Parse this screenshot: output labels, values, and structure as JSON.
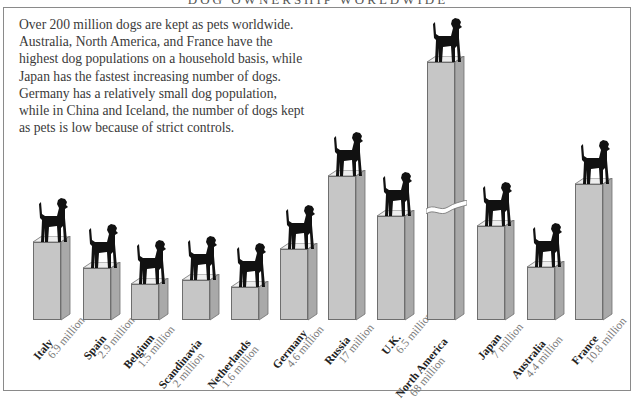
{
  "title": "DOG OWNERSHIP WORLDWIDE",
  "intro": "Over 200 million dogs are kept as pets worldwide. Australia, North America, and France have the highest dog populations on a household basis, while Japan has the fastest increasing number of dogs. Germany has a relatively small dog population, while in China and Iceland, the number of dogs kept as pets is low because of strict controls.",
  "colors": {
    "bar_front": "#c6c6c6",
    "bar_side": "#a9a9a9",
    "bar_top": "#eeeeee",
    "dog": "#111111",
    "border": "#8a8a8a"
  },
  "chart_data": {
    "type": "bar",
    "title": "DOG OWNERSHIP WORLDWIDE",
    "xlabel": "",
    "ylabel": "Number of pet dogs (millions)",
    "categories": [
      "Italy",
      "Spain",
      "Belgium",
      "Scandinavia",
      "Netherlands",
      "Germany",
      "Russia",
      "U.K.",
      "North America",
      "Japan",
      "Australia",
      "France"
    ],
    "values": [
      6.9,
      2.9,
      1.5,
      2,
      1.6,
      4.6,
      17,
      6.5,
      68,
      7,
      4.4,
      10.8
    ],
    "value_labels": [
      "6.9 million",
      "2.9 million",
      "1.5 million",
      "2 million",
      "1.6 million",
      "4.6 million",
      "17 million",
      "6.5 million",
      "68 million",
      "7 million",
      "4.4 million",
      "10.8 million"
    ],
    "annotations": [
      "North America bar has a broken axis (truncated)"
    ],
    "grid": false,
    "legend": null,
    "style": "3D pictorial bars with dog silhouettes on top"
  },
  "bars": [
    {
      "name": "Italy",
      "value": "6.9 million",
      "x": 33,
      "top": 242
    },
    {
      "name": "Spain",
      "value": "2.9 million",
      "x": 83,
      "top": 268
    },
    {
      "name": "Belgium",
      "value": "1.5 million",
      "x": 131,
      "top": 284
    },
    {
      "name": "Scandinavia",
      "value": "2 million",
      "x": 182,
      "top": 280
    },
    {
      "name": "Netherlands",
      "value": "1.6 million",
      "x": 231,
      "top": 287
    },
    {
      "name": "Germany",
      "value": "4.6 million",
      "x": 280,
      "top": 249
    },
    {
      "name": "Russia",
      "value": "17 million",
      "x": 328,
      "top": 176
    },
    {
      "name": "U.K.",
      "value": "6.5 million",
      "x": 377,
      "top": 216
    },
    {
      "name": "North America",
      "value": "68 million",
      "x": 427,
      "top": 62
    },
    {
      "name": "Japan",
      "value": "7 million",
      "x": 477,
      "top": 226
    },
    {
      "name": "Australia",
      "value": "4.4 million",
      "x": 527,
      "top": 267
    },
    {
      "name": "France",
      "value": "10.8 million",
      "x": 575,
      "top": 184
    }
  ]
}
